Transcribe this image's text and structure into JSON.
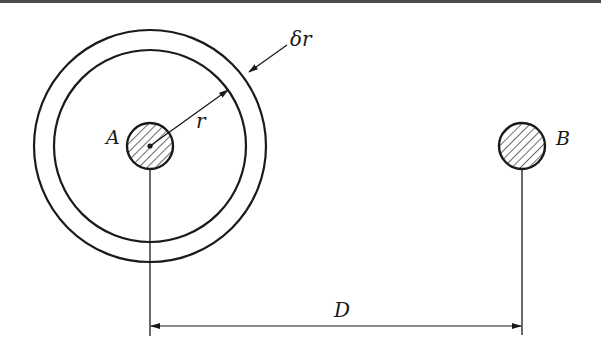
{
  "diagram": {
    "type": "two-conductor field geometry",
    "labels": {
      "conductor_a": "A",
      "conductor_b": "B",
      "radius": "r",
      "shell_thickness": "δr",
      "separation": "D"
    },
    "colors": {
      "stroke": "#1a1a1a",
      "background": "#ffffff",
      "top_rule": "#4a4a4a"
    }
  }
}
